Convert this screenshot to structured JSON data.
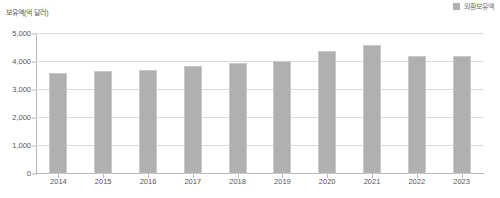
{
  "legend": {
    "position": "top-right",
    "entries": [
      {
        "label": "외환보유액",
        "color": "#b0b0b0",
        "swatch_name": "legend-swatch-foreign-reserves"
      }
    ]
  },
  "axis": {
    "y_title": "보유액(억 달러)",
    "y_ticks": [
      "5,000",
      "4,000",
      "3,000",
      "2,000",
      "1,000",
      "0"
    ],
    "x_labels": [
      "2014",
      "2015",
      "2016",
      "2017",
      "2018",
      "2019",
      "2020",
      "2021",
      "2022",
      "2023"
    ]
  },
  "colors": {
    "bar": "#b0b0b0",
    "bar_stroke": "#c9c9c9",
    "gridline": "#dcdcdc",
    "axis": "#b8b8b8",
    "text": "#555555"
  },
  "chart_data": {
    "type": "bar",
    "title": "",
    "subtitle": "",
    "xlabel": "",
    "ylabel": "보유액(억 달러)",
    "ylim": [
      0,
      5000
    ],
    "ytick_values": [
      0,
      1000,
      2000,
      3000,
      4000,
      5000
    ],
    "grid": "horizontal",
    "legend_position": "top-right",
    "categories": [
      "2014",
      "2015",
      "2016",
      "2017",
      "2018",
      "2019",
      "2020",
      "2021",
      "2022",
      "2023"
    ],
    "series": [
      {
        "name": "외환보유액",
        "color": "#b0b0b0",
        "values": [
          3620,
          3680,
          3710,
          3850,
          3960,
          4050,
          4390,
          4600,
          4230,
          4200
        ]
      }
    ]
  }
}
